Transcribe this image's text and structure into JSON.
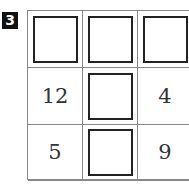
{
  "problem_number": "3",
  "grid": {
    "rows": [
      [
        {
          "type": "blank"
        },
        {
          "type": "blank"
        },
        {
          "type": "blank"
        }
      ],
      [
        {
          "type": "number",
          "value": "12"
        },
        {
          "type": "blank"
        },
        {
          "type": "number",
          "value": "4"
        }
      ],
      [
        {
          "type": "number",
          "value": "5"
        },
        {
          "type": "blank"
        },
        {
          "type": "number",
          "value": "9"
        }
      ]
    ]
  },
  "cells": {
    "r1c0": "12",
    "r1c2": "4",
    "r2c0": "5",
    "r2c2": "9"
  }
}
